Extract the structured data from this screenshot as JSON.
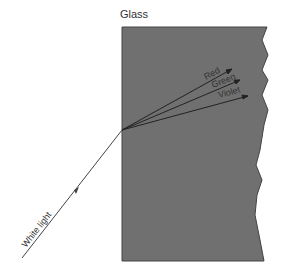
{
  "title": "Glass",
  "incident_label": "White light",
  "rays": [
    {
      "label": "Red"
    },
    {
      "label": "Green"
    },
    {
      "label": "Violet"
    }
  ],
  "colors": {
    "glass": "#707070",
    "ray": "#333333",
    "background": "#ffffff"
  }
}
